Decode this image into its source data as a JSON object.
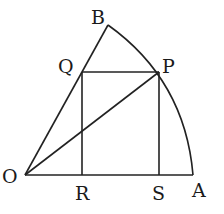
{
  "diagram": {
    "type": "geometry",
    "points": {
      "O": {
        "label": "O",
        "x": 25,
        "y": 175
      },
      "A": {
        "label": "A",
        "x": 193,
        "y": 175
      },
      "B": {
        "label": "B",
        "x": 108,
        "y": 25
      },
      "P": {
        "label": "P",
        "x": 159,
        "y": 72
      },
      "Q": {
        "label": "Q",
        "x": 82,
        "y": 72
      },
      "R": {
        "label": "R",
        "x": 82,
        "y": 175
      },
      "S": {
        "label": "S",
        "x": 159,
        "y": 175
      }
    },
    "segments": [
      "OA",
      "OB",
      "QP",
      "QR",
      "PS",
      "OP"
    ],
    "arcs": [
      "AB"
    ],
    "labels": {
      "O": "O",
      "A": "A",
      "B": "B",
      "P": "P",
      "Q": "Q",
      "R": "R",
      "S": "S"
    },
    "stroke_color": "#222222"
  }
}
